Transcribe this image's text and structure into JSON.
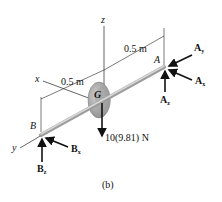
{
  "diagram": {
    "caption": "(b)",
    "axes": {
      "x": "x",
      "y": "y",
      "z": "z"
    },
    "points": {
      "A": "A",
      "B": "B",
      "G": "G"
    },
    "dimensions": [
      {
        "id": "G-to-A",
        "label": "0.5 m"
      },
      {
        "id": "G-to-B",
        "label": "0.5 m"
      }
    ],
    "weight_label": "10(9.81) N",
    "reactions": {
      "A": [
        {
          "base": "A",
          "sub": "y"
        },
        {
          "base": "A",
          "sub": "x"
        },
        {
          "base": "A",
          "sub": "z"
        }
      ],
      "B": [
        {
          "base": "B",
          "sub": "x"
        },
        {
          "base": "B",
          "sub": "z"
        }
      ]
    },
    "colors": {
      "line": "#111111",
      "shaft": "#b8b8b8",
      "disk": "#a8a8a8",
      "disk_dark": "#888888"
    }
  }
}
